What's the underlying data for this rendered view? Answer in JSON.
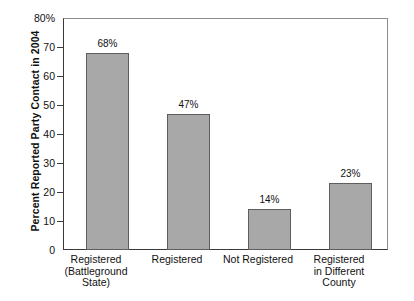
{
  "chart_data": {
    "type": "bar",
    "title": "",
    "xlabel": "",
    "ylabel": "Percent Reported Party Contact in 2004",
    "ylim": [
      0,
      80
    ],
    "ytick_values": [
      80,
      70,
      60,
      50,
      40,
      30,
      20,
      10,
      0
    ],
    "ytick_labels": [
      "80%",
      "70",
      "60",
      "50",
      "40",
      "30",
      "20",
      "10",
      "0"
    ],
    "grid": false,
    "legend": null,
    "bar_color": "#a8a8a8",
    "bar_edge_color": "#5e5e5e",
    "categories": [
      "Registered (Battleground State)",
      "Registered",
      "Not Registered",
      "Registered in Different County"
    ],
    "category_lines": [
      [
        "Registered",
        "(Battleground",
        "State)"
      ],
      [
        "Registered"
      ],
      [
        "Not Registered"
      ],
      [
        "Registered",
        "in Different",
        "County"
      ]
    ],
    "values": [
      68,
      47,
      14,
      23
    ],
    "value_labels": [
      "68%",
      "47%",
      "14%",
      "23%"
    ]
  }
}
